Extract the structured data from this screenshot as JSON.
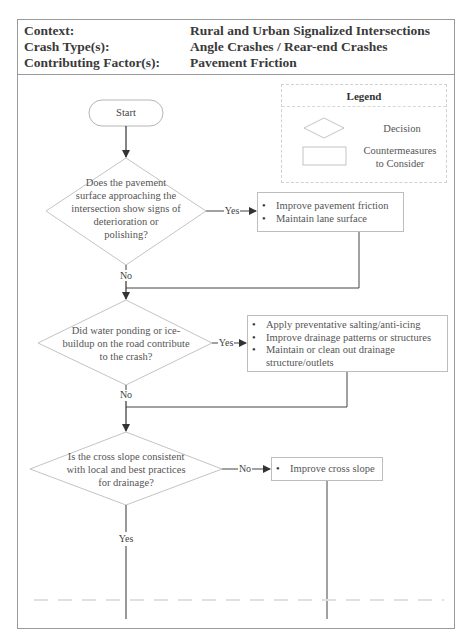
{
  "header": {
    "rows": [
      {
        "label": "Context:",
        "value": "Rural and Urban Signalized Intersections"
      },
      {
        "label": "Crash Type(s):",
        "value": "Angle Crashes / Rear-end Crashes"
      },
      {
        "label": "Contributing Factor(s):",
        "value": "Pavement Friction"
      }
    ]
  },
  "legend": {
    "title": "Legend",
    "decision_label": "Decision",
    "countermeasure_label_line1": "Countermeasures",
    "countermeasure_label_line2": "to Consider"
  },
  "flowchart": {
    "start_label": "Start",
    "decisions": [
      {
        "lines": [
          "Does the pavement",
          "surface approaching the",
          "intersection show signs of",
          "deterioration or",
          "polishing?"
        ],
        "yes_label": "Yes",
        "no_label": "No"
      },
      {
        "lines": [
          "Did water ponding or ice-",
          "buildup on the road contribute",
          "to the crash?"
        ],
        "yes_label": "Yes",
        "no_label": "No"
      },
      {
        "lines": [
          "Is the cross slope consistent",
          "with local and best practices",
          "for drainage?"
        ],
        "no_label": "No",
        "yes_label": "Yes"
      }
    ],
    "countermeasures": [
      {
        "items": [
          "Improve pavement friction",
          "Maintain lane surface"
        ]
      },
      {
        "items": [
          "Apply preventative salting/anti-icing",
          "Improve drainage patterns or structures",
          "Maintain or clean out drainage structure/outlets"
        ]
      },
      {
        "items": [
          "Improve cross slope"
        ]
      }
    ]
  },
  "colors": {
    "frame_border": "#9a9a9a",
    "shape_border": "#bdbdbd",
    "connector": "#444444",
    "text": "#555555"
  }
}
